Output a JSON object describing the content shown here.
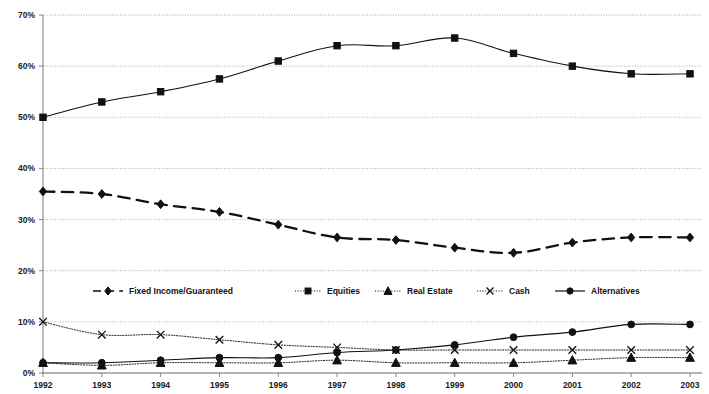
{
  "chart_data": {
    "type": "line",
    "title": "",
    "subtitle": "",
    "xlabel": "",
    "ylabel": "",
    "grid": true,
    "legend_position": "middle-center",
    "ylim": [
      0,
      70
    ],
    "ytick_labels": [
      "0%",
      "10%",
      "20%",
      "30%",
      "40%",
      "50%",
      "60%",
      "70%"
    ],
    "ytick_values": [
      0,
      10,
      20,
      30,
      40,
      50,
      60,
      70
    ],
    "categories": [
      "1992",
      "1993",
      "1994",
      "1995",
      "1996",
      "1997",
      "1998",
      "1999",
      "2000",
      "2001",
      "2002",
      "2003"
    ],
    "x": [
      1992,
      1993,
      1994,
      1995,
      1996,
      1997,
      1998,
      1999,
      2000,
      2001,
      2002,
      2003
    ],
    "series": [
      {
        "name": "Fixed Income/Guaranteed",
        "marker": "diamond",
        "line_style": "dashed",
        "values": [
          35.5,
          35.0,
          33.0,
          31.5,
          29.0,
          26.5,
          26.0,
          24.5,
          23.5,
          25.5,
          26.5,
          26.5
        ]
      },
      {
        "name": "Equities",
        "marker": "square",
        "line_style": "solid",
        "values": [
          50.0,
          53.0,
          55.0,
          57.5,
          61.0,
          64.0,
          64.0,
          65.5,
          62.5,
          60.0,
          58.5,
          58.5
        ]
      },
      {
        "name": "Real Estate",
        "marker": "triangle",
        "line_style": "dotted",
        "values": [
          2.0,
          1.5,
          2.0,
          2.0,
          2.0,
          2.5,
          2.0,
          2.0,
          2.0,
          2.5,
          3.0,
          3.0
        ]
      },
      {
        "name": "Cash",
        "marker": "cross",
        "line_style": "dotted",
        "values": [
          10.0,
          7.5,
          7.5,
          6.5,
          5.5,
          5.0,
          4.5,
          4.5,
          4.5,
          4.5,
          4.5,
          4.5
        ]
      },
      {
        "name": "Alternatives",
        "marker": "circle",
        "line_style": "solid",
        "values": [
          2.0,
          2.0,
          2.5,
          3.0,
          3.0,
          4.0,
          4.5,
          5.5,
          7.0,
          8.0,
          9.5,
          9.5
        ]
      }
    ]
  },
  "legend": {
    "items": [
      {
        "label": "Fixed Income/Guaranteed",
        "marker": "diamond",
        "line_style": "dashed"
      },
      {
        "label": "Equities",
        "marker": "square",
        "line_style": "dotted"
      },
      {
        "label": "Real Estate",
        "marker": "triangle",
        "line_style": "dotted"
      },
      {
        "label": "Cash",
        "marker": "cross",
        "line_style": "dotted"
      },
      {
        "label": "Alternatives",
        "marker": "circle",
        "line_style": "solid"
      }
    ]
  },
  "colors": {
    "series": "#111111",
    "grid": "#8a8a8a",
    "axis": "#6d6d6d",
    "background": "#ffffff",
    "text": "#111111"
  }
}
